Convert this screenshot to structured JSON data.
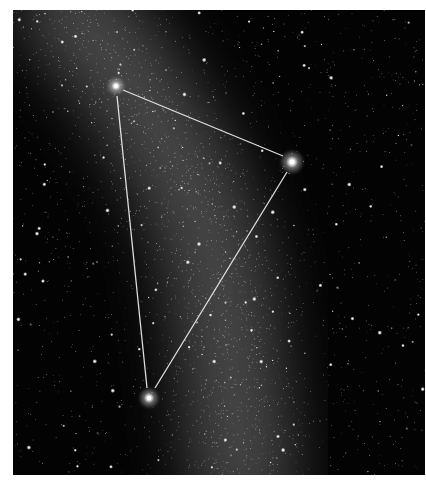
{
  "image": {
    "subject": "Summer Triangle asterism over the Milky Way",
    "frame": {
      "x": 13,
      "y": 10,
      "width": 412,
      "height": 465
    },
    "background_color": "#030303",
    "line_color": "#e8e8e8"
  },
  "stars_highlighted": [
    {
      "name": "top-left-vertex-star",
      "x": 103,
      "y": 76,
      "r": 3.2
    },
    {
      "name": "right-vertex-star",
      "x": 279,
      "y": 152,
      "r": 4.2
    },
    {
      "name": "bottom-vertex-star",
      "x": 136,
      "y": 388,
      "r": 3.6
    }
  ],
  "triangle_edges": [
    {
      "from": [
        110,
        80
      ],
      "to": [
        270,
        146
      ]
    },
    {
      "from": [
        104,
        86
      ],
      "to": [
        134,
        378
      ]
    },
    {
      "from": [
        274,
        162
      ],
      "to": [
        142,
        378
      ]
    }
  ],
  "milky_way": {
    "band": [
      [
        60,
        0
      ],
      [
        110,
        60
      ],
      [
        170,
        160
      ],
      [
        200,
        240
      ],
      [
        215,
        330
      ],
      [
        230,
        465
      ]
    ],
    "width": 120,
    "glow_color": "#8a8a8a"
  },
  "starfield": {
    "count": 2600,
    "seed": 7,
    "bright_count": 60
  }
}
